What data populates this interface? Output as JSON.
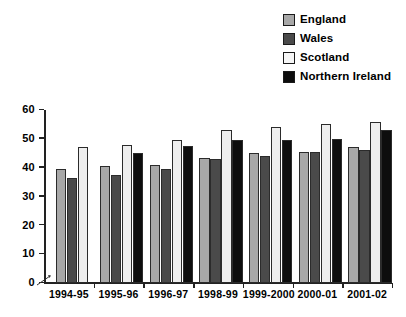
{
  "legend": {
    "position": "top-right",
    "items": [
      {
        "label": "England",
        "key": "england",
        "color": "#a8a8a8",
        "icon": "square-swatch-icon"
      },
      {
        "label": "Wales",
        "key": "wales",
        "color": "#4a4a4a",
        "icon": "square-swatch-icon"
      },
      {
        "label": "Scotland",
        "key": "scotland",
        "color": "#f6f6f6",
        "icon": "square-swatch-icon"
      },
      {
        "label": "Northern Ireland",
        "key": "nireland",
        "color": "#0d0d0d",
        "icon": "square-swatch-icon"
      }
    ]
  },
  "axis": {
    "y_ticks": [
      "0",
      "10",
      "20",
      "30",
      "40",
      "50",
      "60"
    ],
    "x_ticks": [
      "1994-95",
      "1995-96",
      "1996-97",
      "1998-99",
      "1999-2000",
      "2000-01",
      "2001-02"
    ]
  },
  "chart_data": {
    "type": "bar",
    "title": "",
    "xlabel": "",
    "ylabel": "",
    "ylim": [
      0,
      60
    ],
    "ytick_step": 10,
    "grid": false,
    "legend_position": "top-right",
    "categories": [
      "1994-95",
      "1995-96",
      "1996-97",
      "1998-99",
      "1999-2000",
      "2000-01",
      "2001-02"
    ],
    "series": [
      {
        "name": "England",
        "color": "#a8a8a8",
        "values": [
          39.5,
          40.5,
          41.0,
          43.5,
          45.0,
          45.5,
          47.0
        ]
      },
      {
        "name": "Wales",
        "color": "#4a4a4a",
        "values": [
          36.5,
          37.5,
          39.5,
          43.0,
          44.0,
          45.5,
          46.0
        ]
      },
      {
        "name": "Scotland",
        "color": "#f6f6f6",
        "values": [
          47.0,
          48.0,
          49.5,
          53.0,
          54.0,
          55.0,
          56.0
        ]
      },
      {
        "name": "Northern Ireland",
        "color": "#0d0d0d",
        "values": [
          null,
          45.0,
          47.5,
          49.5,
          49.5,
          50.0,
          53.0
        ]
      }
    ]
  }
}
